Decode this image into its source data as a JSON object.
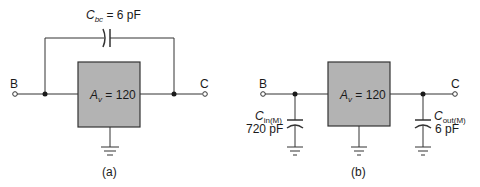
{
  "colors": {
    "wire": "#333333",
    "box_fill": "#b3b3b3",
    "box_stroke": "#333333",
    "text": "#1a1a1a"
  },
  "figure_a": {
    "caption": "(a)",
    "node_in": "B",
    "node_out": "C",
    "amplifier": {
      "symbol": "A",
      "subscript": "v",
      "value": "= 120"
    },
    "feedback_cap": {
      "symbol": "C",
      "subscript": "bc",
      "value": "= 6 pF"
    }
  },
  "figure_b": {
    "caption": "(b)",
    "node_in": "B",
    "node_out": "C",
    "amplifier": {
      "symbol": "A",
      "subscript": "v",
      "value": "= 120"
    },
    "input_cap": {
      "symbol": "C",
      "subscript": "in(M)",
      "value": "720 pF"
    },
    "output_cap": {
      "symbol": "C",
      "subscript": "out(M)",
      "value": "6 pF"
    }
  }
}
